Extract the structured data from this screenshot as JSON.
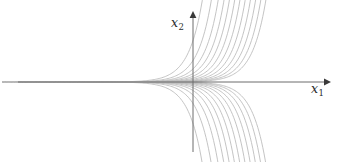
{
  "figure": {
    "kind": "phase-portrait",
    "width": 349,
    "height": 162,
    "background": "#ffffff"
  },
  "axes": {
    "horizontal": {
      "label": "x",
      "subscript": "1",
      "label_text": "x₁",
      "arrow": "right",
      "color": "#6d6d6d",
      "x_start": 18,
      "x_end": 331,
      "y": 82
    },
    "vertical": {
      "label": "x",
      "subscript": "2",
      "label_text": "x₂",
      "arrow": "up",
      "color": "#6d6d6d",
      "x": 193,
      "y_top": 11,
      "y_end": 152
    },
    "origin": {
      "x": 193,
      "y": 82
    }
  },
  "chart_data": {
    "type": "line",
    "title": "",
    "xlabel": "x1",
    "ylabel": "x2",
    "grid": false,
    "legend": null,
    "curve_color": "#b9b9b9",
    "curve_count_upper": 12,
    "curve_count_lower": 12,
    "xlim": [
      -4.55,
      3.3
    ],
    "ylim": [
      -1.85,
      1.85
    ],
    "form": "x2 = s * k * exp(3.05 * x1)",
    "sign_values": [
      1,
      -1
    ],
    "k_values": [
      0.0105,
      0.0152,
      0.0222,
      0.0324,
      0.0474,
      0.0695,
      0.102,
      0.15,
      0.222,
      0.34,
      0.56,
      1.08
    ],
    "series": [
      {
        "name": "upper-1",
        "sign": 1,
        "k": 0.0105
      },
      {
        "name": "upper-2",
        "sign": 1,
        "k": 0.0152
      },
      {
        "name": "upper-3",
        "sign": 1,
        "k": 0.0222
      },
      {
        "name": "upper-4",
        "sign": 1,
        "k": 0.0324
      },
      {
        "name": "upper-5",
        "sign": 1,
        "k": 0.0474
      },
      {
        "name": "upper-6",
        "sign": 1,
        "k": 0.0695
      },
      {
        "name": "upper-7",
        "sign": 1,
        "k": 0.102
      },
      {
        "name": "upper-8",
        "sign": 1,
        "k": 0.15
      },
      {
        "name": "upper-9",
        "sign": 1,
        "k": 0.222
      },
      {
        "name": "upper-10",
        "sign": 1,
        "k": 0.34
      },
      {
        "name": "upper-11",
        "sign": 1,
        "k": 0.56
      },
      {
        "name": "upper-12",
        "sign": 1,
        "k": 1.08
      },
      {
        "name": "lower-1",
        "sign": -1,
        "k": 0.0105
      },
      {
        "name": "lower-2",
        "sign": -1,
        "k": 0.0152
      },
      {
        "name": "lower-3",
        "sign": -1,
        "k": 0.0222
      },
      {
        "name": "lower-4",
        "sign": -1,
        "k": 0.0324
      },
      {
        "name": "lower-5",
        "sign": -1,
        "k": 0.0474
      },
      {
        "name": "lower-6",
        "sign": -1,
        "k": 0.0695
      },
      {
        "name": "lower-7",
        "sign": -1,
        "k": 0.102
      },
      {
        "name": "lower-8",
        "sign": -1,
        "k": 0.15
      },
      {
        "name": "lower-9",
        "sign": -1,
        "k": 0.222
      },
      {
        "name": "lower-10",
        "sign": -1,
        "k": 0.34
      },
      {
        "name": "lower-11",
        "sign": -1,
        "k": 0.56
      },
      {
        "name": "lower-12",
        "sign": -1,
        "k": 1.08
      }
    ]
  }
}
